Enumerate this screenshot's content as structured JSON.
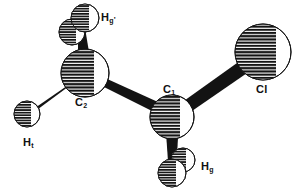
{
  "figure": {
    "kind": "ball-and-stick molecular structure diagram",
    "molecule": "chloroethane (CH2Cl-CH3) conformer",
    "background_color": "#ffffff",
    "ink_color": "#111111",
    "sphere_fill": "hatched-horizontal-black",
    "sphere_highlight": "#ffffff"
  },
  "labels": {
    "h_g_prime": {
      "base": "H",
      "sub": "g",
      "prime": "'",
      "x": 101,
      "y": 12
    },
    "c2": {
      "base": "C",
      "sub": "2",
      "prime": "",
      "x": 75,
      "y": 97
    },
    "c1": {
      "base": "C",
      "sub": "1",
      "prime": "",
      "x": 163,
      "y": 84
    },
    "cl": {
      "base": "Cl",
      "sub": "",
      "prime": "",
      "x": 256,
      "y": 84
    },
    "h_t": {
      "base": "H",
      "sub": "t",
      "prime": "",
      "x": 23,
      "y": 137
    },
    "h_g": {
      "base": "H",
      "sub": "g",
      "prime": "",
      "x": 201,
      "y": 161
    }
  },
  "atoms": [
    {
      "id": "C2",
      "element": "C",
      "cx": 85,
      "cy": 73,
      "r": 24,
      "label": "C2"
    },
    {
      "id": "C1",
      "element": "C",
      "cx": 172,
      "cy": 117,
      "r": 22,
      "label": "C1"
    },
    {
      "id": "Cl",
      "element": "Cl",
      "cx": 263,
      "cy": 52,
      "r": 28,
      "label": "Cl"
    },
    {
      "id": "Ht",
      "element": "H",
      "cx": 27,
      "cy": 114,
      "r": 13,
      "label": "Ht"
    },
    {
      "id": "Hg_prime_front",
      "element": "H",
      "cx": 85,
      "cy": 18,
      "r": 14,
      "label": "Hg'"
    },
    {
      "id": "Hg_prime_back",
      "element": "H",
      "cx": 72,
      "cy": 32,
      "r": 13,
      "label": ""
    },
    {
      "id": "Hg_front",
      "element": "H",
      "cx": 172,
      "cy": 173,
      "r": 14,
      "label": "Hg"
    },
    {
      "id": "Hg_back",
      "element": "H",
      "cx": 183,
      "cy": 160,
      "r": 12,
      "label": ""
    }
  ],
  "bonds": [
    {
      "from": "C2",
      "to": "C1",
      "width": 9
    },
    {
      "from": "C1",
      "to": "Cl",
      "width": 8
    },
    {
      "from": "C2",
      "to": "Ht",
      "width": 7
    },
    {
      "from": "C2",
      "to": "Hg_prime_front",
      "width": 7
    },
    {
      "from": "C1",
      "to": "Hg_front",
      "width": 7
    }
  ]
}
